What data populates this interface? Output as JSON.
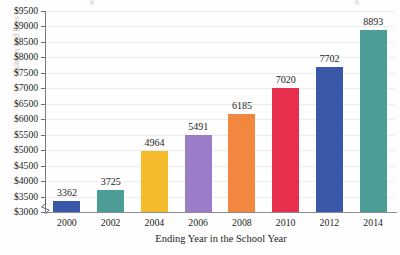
{
  "chart_data": {
    "type": "bar",
    "title": "",
    "xlabel": "Ending Year in the School Year",
    "ylabel": "Tuition and Fees",
    "categories": [
      "2000",
      "2002",
      "2004",
      "2006",
      "2008",
      "2010",
      "2012",
      "2014"
    ],
    "values": [
      3362,
      3725,
      4964,
      5491,
      6185,
      7020,
      7702,
      8893
    ],
    "value_labels": [
      "3362",
      "3725",
      "4964",
      "5491",
      "6185",
      "7020",
      "7702",
      "8893"
    ],
    "ylim": [
      3000,
      9500
    ],
    "y_axis_broken": true,
    "ytick_labels": [
      "$9500",
      "$9000",
      "$8500",
      "$8000",
      "$7500",
      "$7000",
      "$6500",
      "$6000",
      "$5500",
      "$5000",
      "$4500",
      "$4000",
      "$3500",
      "$3000"
    ],
    "ytick_values": [
      9500,
      9000,
      8500,
      8000,
      7500,
      7000,
      6500,
      6000,
      5500,
      5000,
      4500,
      4000,
      3500,
      3000
    ],
    "grid": true,
    "legend": "none",
    "bar_colors": [
      "#3a58a8",
      "#4c9d95",
      "#f4bb2c",
      "#9b7cc8",
      "#f2883f",
      "#e82f4e",
      "#3a58a8",
      "#4c9d95"
    ],
    "gridline_color": "#ededf0",
    "axis_color": "#7a7a80",
    "text_color": "#231f20"
  }
}
